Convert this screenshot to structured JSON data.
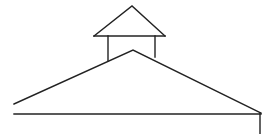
{
  "drawing": {
    "description": "Line drawing of a roof with a cupola",
    "stroke_color": "#222222",
    "background": "#ffffff",
    "stroke_width": 1.4,
    "cupola_roof": {
      "points": [
        [
          94,
          36
        ],
        [
          132,
          6
        ],
        [
          165,
          36
        ]
      ]
    },
    "cupola_eave": {
      "x1": 94,
      "y1": 36,
      "x2": 165,
      "y2": 36
    },
    "cupola_post_left": {
      "x1": 108,
      "y1": 36,
      "x2": 108,
      "y2": 61
    },
    "cupola_post_right": {
      "x1": 155,
      "y1": 36,
      "x2": 155,
      "y2": 57
    },
    "main_roof": {
      "points": [
        [
          14,
          104
        ],
        [
          133,
          50
        ],
        [
          261,
          113
        ]
      ]
    },
    "base_line": {
      "x1": 14,
      "y1": 114,
      "x2": 261,
      "y2": 114
    },
    "corner_post": {
      "x1": 260,
      "y1": 113,
      "x2": 260,
      "y2": 134
    }
  }
}
